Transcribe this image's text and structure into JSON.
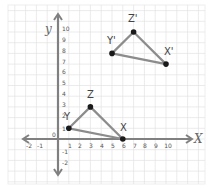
{
  "diagram": {
    "title": "",
    "axes": {
      "x_label": "X",
      "y_label": "y",
      "x_ticks": [
        "-2",
        "-1",
        "1",
        "2",
        "3",
        "4",
        "5",
        "6",
        "7",
        "8",
        "9",
        "10"
      ],
      "y_ticks": [
        "10",
        "9",
        "8",
        "7",
        "6",
        "5",
        "4",
        "3",
        "2",
        "1",
        "-1",
        "-2"
      ],
      "origin_label": "0",
      "x_range": [
        -2,
        10
      ],
      "y_range": [
        -2,
        10
      ]
    },
    "triangles": [
      {
        "name": "XYZ",
        "vertices": [
          {
            "label": "X",
            "x": 6,
            "y": 0
          },
          {
            "label": "Y",
            "x": 1,
            "y": 1
          },
          {
            "label": "Z",
            "x": 3,
            "y": 3
          }
        ]
      },
      {
        "name": "X'Y'Z'",
        "vertices": [
          {
            "label": "X'",
            "x": 10,
            "y": 7
          },
          {
            "label": "Y'",
            "x": 5,
            "y": 8
          },
          {
            "label": "Z'",
            "x": 7,
            "y": 10
          }
        ]
      }
    ],
    "colors": {
      "paper": "#ffffff",
      "grid": "#e2e2e2",
      "axis": "#808080",
      "edge": "#8c8c8c",
      "point": "#1a1a1a",
      "text": "#444444"
    }
  }
}
